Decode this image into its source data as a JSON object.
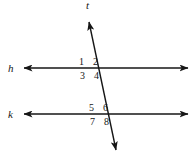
{
  "figure": {
    "kind": "geometry-diagram",
    "background_color": "#ffffff",
    "stroke_color": "#161616",
    "lines": [
      {
        "id": "h",
        "label": "h",
        "orientation": "horizontal",
        "label_x": 8,
        "label_y": 72,
        "x1": 24,
        "y1": 68,
        "x2": 188,
        "y2": 68,
        "arrows": "both"
      },
      {
        "id": "k",
        "label": "k",
        "orientation": "horizontal",
        "label_x": 8,
        "label_y": 118,
        "x1": 24,
        "y1": 114,
        "x2": 188,
        "y2": 114,
        "arrows": "both"
      },
      {
        "id": "t",
        "label": "t",
        "orientation": "transversal",
        "label_x": 86,
        "label_y": 9,
        "x1": 89,
        "y1": 22,
        "x2": 116,
        "y2": 150,
        "arrows": "both"
      }
    ],
    "angles": [
      {
        "label": "1",
        "x": 79,
        "y": 65,
        "at": "h",
        "position": "upper-left"
      },
      {
        "label": "2",
        "x": 93,
        "y": 65,
        "at": "h",
        "position": "upper-right"
      },
      {
        "label": "3",
        "x": 80,
        "y": 79,
        "at": "h",
        "position": "lower-left"
      },
      {
        "label": "4",
        "x": 94,
        "y": 79,
        "at": "h",
        "position": "lower-right"
      },
      {
        "label": "5",
        "x": 89,
        "y": 111,
        "at": "k",
        "position": "upper-left"
      },
      {
        "label": "6",
        "x": 103,
        "y": 111,
        "at": "k",
        "position": "upper-right"
      },
      {
        "label": "7",
        "x": 90,
        "y": 125,
        "at": "k",
        "position": "lower-left"
      },
      {
        "label": "8",
        "x": 104,
        "y": 125,
        "at": "k",
        "position": "lower-right"
      }
    ]
  }
}
